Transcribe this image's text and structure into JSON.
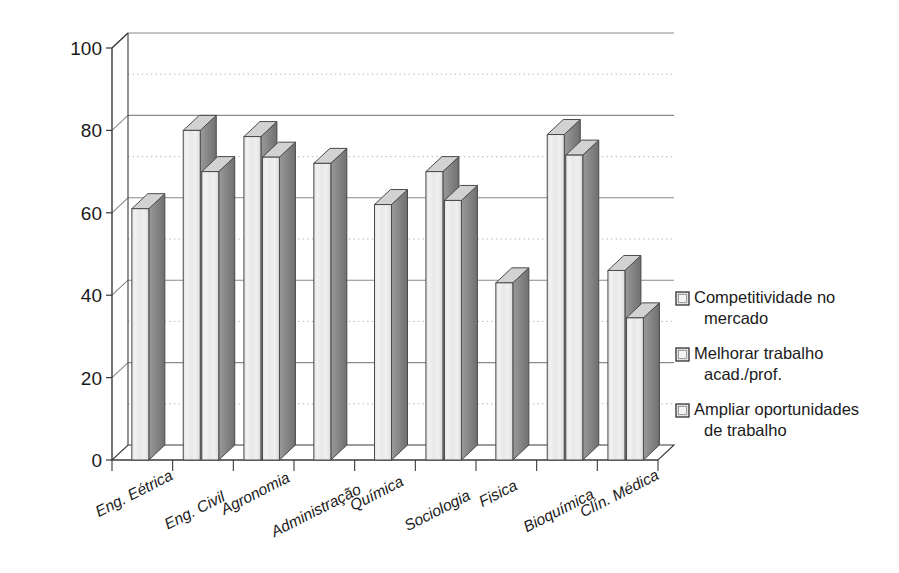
{
  "chart_data": {
    "type": "bar",
    "title": "",
    "xlabel": "",
    "ylabel": "",
    "ylim": [
      0,
      100
    ],
    "yticks": [
      0,
      20,
      40,
      60,
      80,
      100
    ],
    "minor_gridlines": [
      10,
      30,
      50,
      70,
      90
    ],
    "grid": true,
    "legend_position": "right",
    "categories": [
      "Eng. Eétrica",
      "Eng. Civil",
      "Agronomia",
      "Administração",
      "Química",
      "Sociologia",
      "Fisica",
      "Bioquímica",
      "Clín. Médica"
    ],
    "series": [
      {
        "name": "Competitividade no mercado",
        "values": [
          61,
          null,
          null,
          null,
          null,
          null,
          null,
          null,
          null
        ]
      },
      {
        "name": "Melhorar trabalho acad./prof.",
        "values": [
          null,
          80,
          78.5,
          72,
          62,
          70,
          43,
          79,
          46
        ]
      },
      {
        "name": "Ampliar oportunidades de trabalho",
        "values": [
          null,
          70,
          73.5,
          null,
          null,
          63,
          null,
          74,
          34.5
        ]
      }
    ]
  },
  "legend": {
    "items": [
      {
        "line1": "Competitividade no",
        "line2": "mercado"
      },
      {
        "line1": "Melhorar trabalho",
        "line2": "acad./prof."
      },
      {
        "line1": "Ampliar oportunidades",
        "line2": "de trabalho"
      }
    ]
  },
  "axis": {
    "y_labels": [
      "100",
      "80",
      "60",
      "40",
      "20",
      "0"
    ]
  },
  "colors": {
    "bar_face": "#ebebeb",
    "bar_side": "#878787",
    "bar_top": "#d2d2d2",
    "bar_outline": "#4a4a4a",
    "grid_major": "#8a8a8a",
    "grid_minor": "#b5b5b5",
    "axis": "#3a3a3a",
    "text": "#1a1a1a",
    "background": "#ffffff"
  }
}
